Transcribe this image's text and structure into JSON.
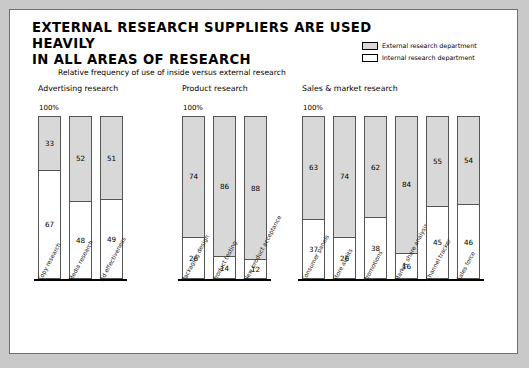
{
  "slide": {
    "title": "EXTERNAL RESEARCH SUPPLIERS ARE USED HEAVILY\nIN ALL AREAS OF RESEARCH",
    "subtitle": "Relative frequency of use of inside versus external research",
    "axis_top_label": "100%"
  },
  "legend": {
    "items": [
      {
        "label": "External research department",
        "color": "#d8d8d8"
      },
      {
        "label": "Internal research department",
        "color": "#ffffff"
      }
    ]
  },
  "chart_data": {
    "type": "bar",
    "title": "EXTERNAL RESEARCH SUPPLIERS ARE USED HEAVILY IN ALL AREAS OF RESEARCH",
    "subtitle": "Relative frequency of use of inside versus external research",
    "xlabel": "",
    "ylabel": "",
    "ylim": [
      0,
      100
    ],
    "stacked": true,
    "stack_total": 100,
    "grid": false,
    "legend_position": "top-right",
    "series": [
      {
        "name": "External research department",
        "color": "#d8d8d8"
      },
      {
        "name": "Internal research department",
        "color": "#ffffff"
      }
    ],
    "groups": [
      {
        "name": "Advertising research",
        "categories": [
          "Copy research",
          "Media research",
          "Ad effectiveness"
        ],
        "external": [
          33,
          52,
          51
        ],
        "internal": [
          67,
          48,
          49
        ]
      },
      {
        "name": "Product research",
        "categories": [
          "Packaging design",
          "Product testing",
          "New product acceptance"
        ],
        "external": [
          74,
          86,
          88
        ],
        "internal": [
          26,
          14,
          12
        ]
      },
      {
        "name": "Sales & market research",
        "categories": [
          "Consumer panels",
          "Store audits",
          "Promotions",
          "Market share analysis",
          "Channel tracker",
          "Sales force"
        ],
        "external": [
          63,
          74,
          62,
          84,
          55,
          54
        ],
        "internal": [
          37,
          26,
          38,
          16,
          45,
          46
        ]
      }
    ]
  }
}
